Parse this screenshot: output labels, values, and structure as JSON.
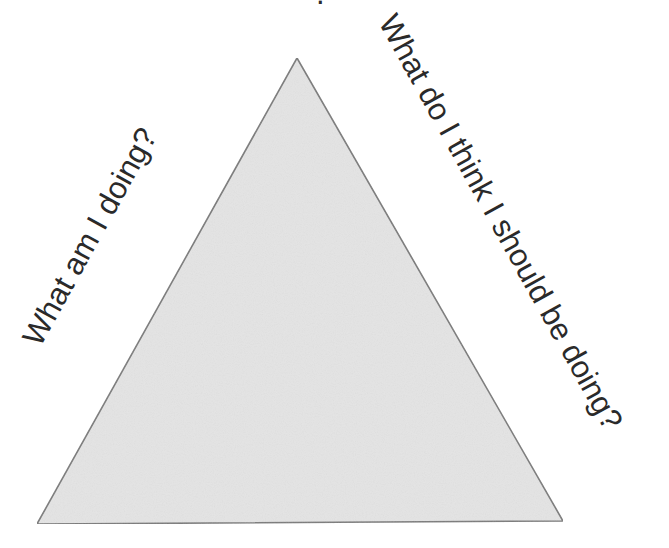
{
  "diagram": {
    "type": "triangle",
    "fill_color": "#e4e4e4",
    "stroke_color": "#7a7a7a",
    "text_color": "#2a2a2a",
    "top_partial_glyph": ".",
    "labels": {
      "left_side": "What am I doing?",
      "right_side": "What do I think I should be doing?"
    }
  }
}
